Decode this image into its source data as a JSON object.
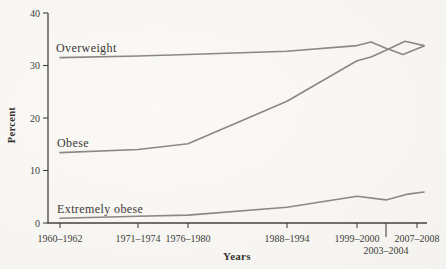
{
  "colors": {
    "line": "#8b8884",
    "axis": "#454240",
    "text": "#403d39",
    "background": "#f7f6f2"
  },
  "chart_data": {
    "type": "line",
    "title": "",
    "ylabel": "Percent",
    "xlabel": "Years",
    "ylim": [
      0,
      40
    ],
    "grid": false,
    "legend": "inline-labels-at-line-start",
    "y_ticks": [
      40,
      30,
      20,
      10,
      0
    ],
    "x_categories": [
      "1960–1962",
      "1971–1974",
      "1976–1980",
      "1988–1994",
      "1999–2000",
      "2003–2004",
      "2007–2008"
    ],
    "series": [
      {
        "name": "Overweight",
        "values_at_categories": [
          31.5,
          31.8,
          32.1,
          32.7,
          33.8,
          33.3,
          33.7
        ],
        "render_points": [
          [
            60,
            31.5
          ],
          [
            138,
            31.8
          ],
          [
            188,
            32.1
          ],
          [
            287,
            32.7
          ],
          [
            357,
            33.8
          ],
          [
            371,
            34.5
          ],
          [
            386,
            33.3
          ],
          [
            403,
            32.1
          ],
          [
            424,
            33.7
          ]
        ]
      },
      {
        "name": "Obese",
        "values_at_categories": [
          13.4,
          14.0,
          15.1,
          23.2,
          30.9,
          32.9,
          33.8
        ],
        "render_points": [
          [
            60,
            13.4
          ],
          [
            138,
            14.0
          ],
          [
            188,
            15.1
          ],
          [
            287,
            23.2
          ],
          [
            357,
            30.9
          ],
          [
            371,
            31.6
          ],
          [
            386,
            32.9
          ],
          [
            405,
            34.6
          ],
          [
            424,
            33.8
          ]
        ]
      },
      {
        "name": "Extremely obese",
        "values_at_categories": [
          0.9,
          1.3,
          1.5,
          3.0,
          5.1,
          4.4,
          5.9
        ],
        "render_points": [
          [
            60,
            0.9
          ],
          [
            138,
            1.3
          ],
          [
            188,
            1.5
          ],
          [
            287,
            3.0
          ],
          [
            357,
            5.1
          ],
          [
            386,
            4.4
          ],
          [
            408,
            5.5
          ],
          [
            424,
            5.9
          ]
        ]
      }
    ],
    "layout": {
      "plot": {
        "axis_x": 48,
        "axis_y_top": 13,
        "axis_y_bottom": 223,
        "axis_x_right": 427,
        "px_per_unit": 5.25
      },
      "x_tick_px": [
        60,
        138,
        188,
        287,
        357,
        386,
        417
      ],
      "x_tick_rows": [
        1,
        1,
        1,
        1,
        1,
        2,
        1
      ],
      "long_tick_index": 5
    }
  }
}
